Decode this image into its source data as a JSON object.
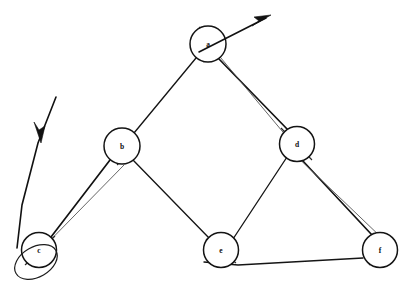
{
  "diagram": {
    "background_color": "#ffffff",
    "ink_color": "#121212",
    "width": 409,
    "height": 288,
    "node_radius": 17.5,
    "nodes": [
      {
        "id": "a",
        "label": "a",
        "cx": 208,
        "cy": 44,
        "r": 18
      },
      {
        "id": "b",
        "label": "b",
        "cx": 122,
        "cy": 146,
        "r": 18
      },
      {
        "id": "c",
        "label": "c",
        "cx": 39,
        "cy": 250,
        "r": 17.5
      },
      {
        "id": "d",
        "label": "d",
        "cx": 297,
        "cy": 144,
        "r": 17.5
      },
      {
        "id": "e",
        "label": "e",
        "cx": 221,
        "cy": 250,
        "r": 17.5
      },
      {
        "id": "f",
        "label": "f",
        "cx": 380,
        "cy": 250,
        "r": 17.5
      }
    ],
    "edges": [
      {
        "from": "a",
        "to": "b",
        "style": "single",
        "x1": 196,
        "y1": 58,
        "x2": 134,
        "y2": 133
      },
      {
        "from": "a",
        "to": "d",
        "style": "double",
        "x1": 219,
        "y1": 59,
        "x2": 288,
        "y2": 131
      },
      {
        "from": "b",
        "to": "c",
        "style": "double",
        "x1": 111,
        "y1": 160,
        "x2": 51,
        "y2": 237
      },
      {
        "from": "b",
        "to": "e",
        "style": "single",
        "x1": 134,
        "y1": 159,
        "x2": 209,
        "y2": 238
      },
      {
        "from": "d",
        "to": "e",
        "style": "single",
        "x1": 287,
        "y1": 157,
        "x2": 233,
        "y2": 238
      },
      {
        "from": "d",
        "to": "f",
        "style": "double",
        "x1": 303,
        "y1": 160,
        "x2": 373,
        "y2": 234
      },
      {
        "from": "e",
        "to": "f",
        "style": "single",
        "x1": 238,
        "y1": 263,
        "x2": 363,
        "y2": 258
      }
    ],
    "arrows": [
      {
        "name": "outgoing-arrow-from-a",
        "direction": "up-right",
        "x1": 200,
        "y1": 52,
        "x2": 268,
        "y2": 17,
        "head_at": "end"
      },
      {
        "name": "incoming-arrow-to-c",
        "direction": "down-left",
        "x1": 55,
        "y1": 98,
        "x2": 16,
        "y2": 250,
        "head_at": "middle",
        "head_x": 37,
        "head_y": 138
      }
    ],
    "loops": [
      {
        "name": "loop-below-c",
        "cx": 36,
        "cy": 262,
        "rx": 22,
        "ry": 16,
        "rotate": -28
      },
      {
        "name": "arc-through-a",
        "d": "M 200 27 Q 218 44 202 62"
      },
      {
        "name": "arc-through-b",
        "d": "M 114 133 Q 132 150 116 164"
      },
      {
        "name": "arc-through-f",
        "d": "M 373 234 Q 386 249 370 264"
      }
    ]
  },
  "legend": {
    "caption": ""
  }
}
